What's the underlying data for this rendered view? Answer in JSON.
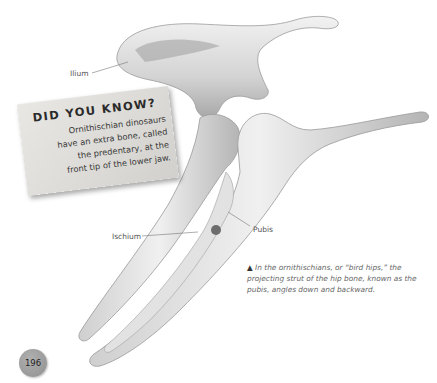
{
  "labels": {
    "ilium": "Ilium",
    "ischium": "Ischium",
    "pubis": "Pubis"
  },
  "did_you_know": {
    "title": "DID YOU KNOW?",
    "lines": [
      "Ornithischian dinosaurs",
      "have an extra bone, called",
      "the predentary, at the",
      "front tip of the lower jaw."
    ]
  },
  "caption": {
    "marker": "▲",
    "text": "In the ornithischians, or “bird hips,” the projecting strut of the hip bone, known as the pubis, angles down and backward."
  },
  "page_number": "196",
  "colors": {
    "bone_light": "#eeeeee",
    "bone_mid": "#c8c8c8",
    "bone_dark": "#8c8c8c",
    "page_badge": "#9e9e9e"
  }
}
